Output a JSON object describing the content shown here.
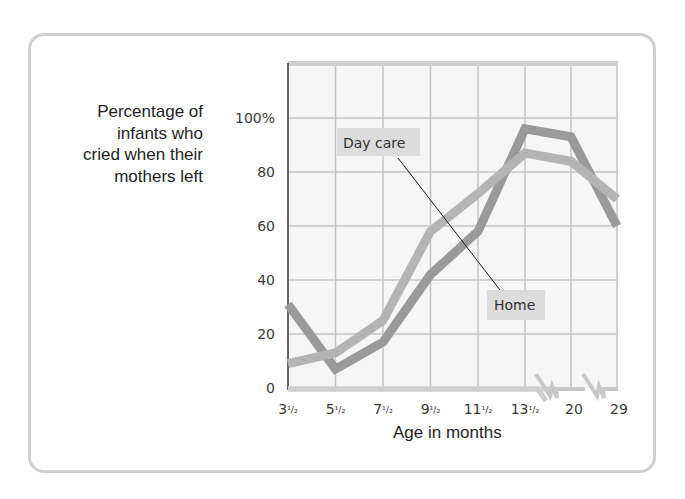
{
  "chart_data": {
    "type": "line",
    "title": "",
    "ylabel": "Percentage of infants who cried when their mothers left",
    "ylabel_lines": [
      "Percentage of",
      "infants who",
      "cried when their",
      "mothers left"
    ],
    "xlabel": "Age in months",
    "categories": [
      "3½",
      "5½",
      "7½",
      "9½",
      "11½",
      "13½",
      "20",
      "29"
    ],
    "x_ticks": [
      {
        "whole": "3",
        "frac": "1/2"
      },
      {
        "whole": "5",
        "frac": "1/2"
      },
      {
        "whole": "7",
        "frac": "1/2"
      },
      {
        "whole": "9",
        "frac": "1/2"
      },
      {
        "whole": "11",
        "frac": "1/2"
      },
      {
        "whole": "13",
        "frac": "1/2"
      },
      {
        "whole": "20",
        "frac": ""
      },
      {
        "whole": "29",
        "frac": ""
      }
    ],
    "y_ticks": [
      "0",
      "20",
      "40",
      "60",
      "80",
      "100%"
    ],
    "ylim": [
      0,
      100
    ],
    "grid": true,
    "axis_breaks": [
      "between 13½ and 20",
      "between 20 and 29"
    ],
    "series": [
      {
        "name": "Day care",
        "color": "#b4b4b4",
        "values": [
          9,
          13,
          25,
          58,
          72,
          87,
          84,
          70
        ]
      },
      {
        "name": "Home",
        "color": "#9a9a9a",
        "values": [
          31,
          7,
          17,
          42,
          58,
          96,
          93,
          60
        ]
      }
    ],
    "annotations": [
      {
        "text": "Day care",
        "points_to": "Day care"
      },
      {
        "text": "Home",
        "points_to": "Home"
      }
    ],
    "legend": "inline labels"
  }
}
